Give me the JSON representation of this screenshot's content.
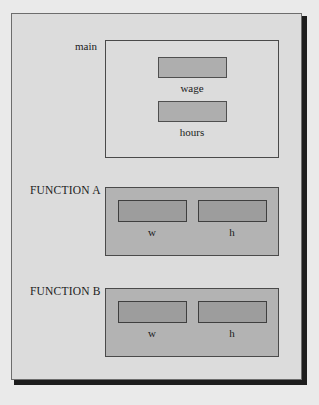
{
  "diagram": {
    "background_color": "#dcdcdc",
    "page_color": "#eaeaea",
    "group_fill_color": "#b3b3b3",
    "cell_fill_color": "#aeaeae",
    "border_color": "#4a4a4a"
  },
  "groups": [
    {
      "id": "main",
      "label": "main",
      "style": "transparent",
      "cells": [
        {
          "id": "wage",
          "label": "wage"
        },
        {
          "id": "hours",
          "label": "hours"
        }
      ]
    },
    {
      "id": "function-a",
      "label": "FUNCTION A",
      "style": "filled",
      "cells": [
        {
          "id": "a-w",
          "label": "w"
        },
        {
          "id": "a-h",
          "label": "h"
        }
      ]
    },
    {
      "id": "function-b",
      "label": "FUNCTION B",
      "style": "filled",
      "cells": [
        {
          "id": "b-w",
          "label": "w"
        },
        {
          "id": "b-h",
          "label": "h"
        }
      ]
    }
  ]
}
